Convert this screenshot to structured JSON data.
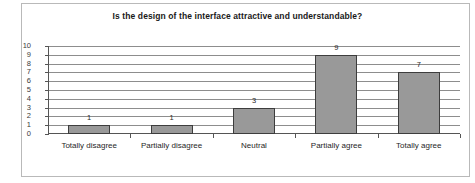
{
  "chart_data": {
    "type": "bar",
    "title": "Is the design of the interface attractive and understandable?",
    "xlabel": "",
    "ylabel": "",
    "categories": [
      "Totally disagree",
      "Partially disagree",
      "Neutral",
      "Partially agree",
      "Totally agree"
    ],
    "values": [
      1,
      1,
      3,
      9,
      7
    ],
    "data_labels": [
      "1",
      "1",
      "3",
      "9",
      "7"
    ],
    "ylim": [
      0,
      10
    ],
    "ytick_labels": [
      "10",
      "9",
      "8",
      "7",
      "6",
      "5",
      "4",
      "3",
      "2",
      "1",
      "0"
    ],
    "ytick_values": [
      10,
      9,
      8,
      7,
      6,
      5,
      4,
      3,
      2,
      1,
      0
    ],
    "grid": true,
    "legend": false,
    "legend_position": "none",
    "colors": {
      "bar_fill": "#999999",
      "bar_border": "#3d3d3d",
      "gridline": "#8d8d8d",
      "axis": "#555555",
      "text": "#1f1f1f",
      "frame": "#b9b9b9",
      "background": "#ffffff"
    }
  }
}
